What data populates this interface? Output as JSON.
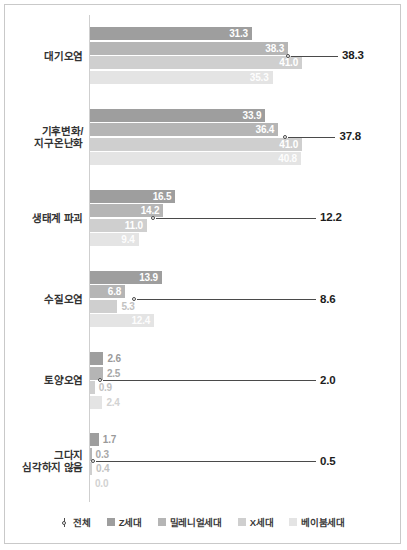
{
  "chart_data": {
    "type": "bar",
    "orientation": "horizontal",
    "title": "",
    "xlabel": "",
    "ylabel": "",
    "xlim": [
      0,
      45
    ],
    "grid": false,
    "legend_position": "bottom",
    "categories": [
      "대기오염",
      "기후변화/\n지구온난화",
      "생태계 파괴",
      "수질오염",
      "토양오염",
      "그다지\n심각하지 않음"
    ],
    "series": [
      {
        "name": "Z세대",
        "color": "#9e9e9e",
        "values": [
          31.3,
          33.9,
          16.5,
          13.9,
          2.6,
          1.7
        ]
      },
      {
        "name": "밀레니얼세대",
        "color": "#b5b5b5",
        "values": [
          38.3,
          36.4,
          14.2,
          6.8,
          2.5,
          0.3
        ]
      },
      {
        "name": "X세대",
        "color": "#cfcfcf",
        "values": [
          41.0,
          41.0,
          11.0,
          5.3,
          0.9,
          0.4
        ]
      },
      {
        "name": "베이붐세대",
        "color": "#e4e4e4",
        "values": [
          35.3,
          40.8,
          9.4,
          12.4,
          2.4,
          0.0
        ]
      }
    ],
    "overall": {
      "name": "전체",
      "marker": "open-circle-with-leader-line",
      "values": [
        38.3,
        37.8,
        12.2,
        8.6,
        2.0,
        0.5
      ]
    }
  },
  "legend": {
    "items": [
      {
        "label": "전체",
        "type": "marker",
        "color": "#4a4a4a"
      },
      {
        "label": "Z세대",
        "type": "swatch",
        "color": "#9e9e9e"
      },
      {
        "label": "밀레니얼세대",
        "type": "swatch",
        "color": "#b5b5b5"
      },
      {
        "label": "X세대",
        "type": "swatch",
        "color": "#cfcfcf"
      },
      {
        "label": "베이붐세대",
        "type": "swatch",
        "color": "#e4e4e4"
      }
    ]
  }
}
